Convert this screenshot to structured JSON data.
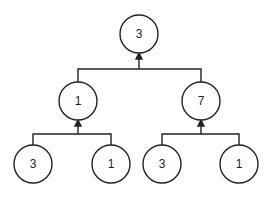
{
  "diagram": {
    "type": "tree",
    "colors": {
      "stroke": "#222222",
      "background": "#ffffff",
      "text": "#222222"
    },
    "nodes": [
      {
        "id": "root",
        "label": "3",
        "cx": 139,
        "cy": 34
      },
      {
        "id": "mid-left",
        "label": "1",
        "cx": 78,
        "cy": 101
      },
      {
        "id": "mid-right",
        "label": "7",
        "cx": 201,
        "cy": 101
      },
      {
        "id": "leaf-1",
        "label": "3",
        "cx": 33,
        "cy": 164
      },
      {
        "id": "leaf-2",
        "label": "1",
        "cx": 111,
        "cy": 164
      },
      {
        "id": "leaf-3",
        "label": "3",
        "cx": 162,
        "cy": 164
      },
      {
        "id": "leaf-4",
        "label": "1",
        "cx": 239,
        "cy": 164
      }
    ],
    "edges": [
      {
        "from": "mid-left",
        "to": "root"
      },
      {
        "from": "mid-right",
        "to": "root"
      },
      {
        "from": "leaf-1",
        "to": "mid-left"
      },
      {
        "from": "leaf-2",
        "to": "mid-left"
      },
      {
        "from": "leaf-3",
        "to": "mid-right"
      },
      {
        "from": "leaf-4",
        "to": "mid-right"
      }
    ]
  }
}
